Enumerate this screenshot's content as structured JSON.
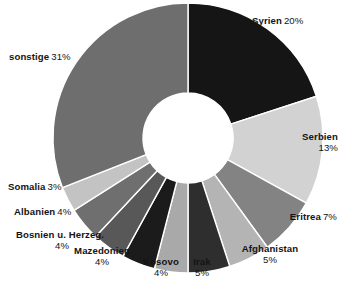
{
  "chart_data": {
    "type": "pie",
    "variant": "donut",
    "title": "",
    "subtitle": "",
    "xlabel": "",
    "ylabel": "",
    "unit": "%",
    "legend": "none",
    "grid": false,
    "start_angle_deg": 0,
    "direction": "clockwise",
    "total": 100,
    "categories": [
      "Syrien",
      "Serbien",
      "Eritrea",
      "Afghanistan",
      "Irak",
      "Kosovo",
      "Mazedonien",
      "Bosnien u. Herzeg.",
      "Albanien",
      "Somalia",
      "sonstige"
    ],
    "values": [
      20,
      13,
      7,
      5,
      5,
      4,
      4,
      4,
      4,
      3,
      31
    ],
    "colors": [
      "#151515",
      "#d2d2d2",
      "#838383",
      "#b4b4b4",
      "#2e2e2e",
      "#a9a9a9",
      "#1b1b1b",
      "#585858",
      "#6f6f6f",
      "#c3c3c3",
      "#6e6e6e"
    ],
    "slices": [
      {
        "name": "Syrien",
        "value": 20,
        "percent_label": "20%",
        "color": "#151515",
        "label_text": "Syrien 20%"
      },
      {
        "name": "Serbien",
        "value": 13,
        "percent_label": "13%",
        "color": "#d2d2d2",
        "label_text": "Serbien 13%"
      },
      {
        "name": "Eritrea",
        "value": 7,
        "percent_label": "7%",
        "color": "#838383",
        "label_text": "Eritrea 7%"
      },
      {
        "name": "Afghanistan",
        "value": 5,
        "percent_label": "5%",
        "color": "#b4b4b4",
        "label_text": "Afghanistan 5%"
      },
      {
        "name": "Irak",
        "value": 5,
        "percent_label": "5%",
        "color": "#2e2e2e",
        "label_text": "Irak 5%"
      },
      {
        "name": "Kosovo",
        "value": 4,
        "percent_label": "4%",
        "color": "#a9a9a9",
        "label_text": "Kosovo 4%"
      },
      {
        "name": "Mazedonien",
        "value": 4,
        "percent_label": "4%",
        "color": "#1b1b1b",
        "label_text": "Mazedonien 4%"
      },
      {
        "name": "Bosnien u. Herzeg.",
        "value": 4,
        "percent_label": "4%",
        "color": "#585858",
        "label_text": "Bosnien u. Herzeg. 4%"
      },
      {
        "name": "Albanien",
        "value": 4,
        "percent_label": "4%",
        "color": "#6f6f6f",
        "label_text": "Albanien 4%"
      },
      {
        "name": "Somalia",
        "value": 3,
        "percent_label": "3%",
        "color": "#c3c3c3",
        "label_text": "Somalia 3%"
      },
      {
        "name": "sonstige",
        "value": 31,
        "percent_label": "31%",
        "color": "#6e6e6e",
        "label_text": "sonstige 31%"
      }
    ]
  },
  "labels": {
    "syrien": {
      "name": "Syrien",
      "percent": "20%"
    },
    "serbien": {
      "name": "Serbien",
      "percent": "13%"
    },
    "eritrea": {
      "name": "Eritrea",
      "percent": "7%"
    },
    "afghanistan": {
      "name": "Afghanistan",
      "percent": "5%"
    },
    "irak": {
      "name": "Irak",
      "percent": "5%"
    },
    "kosovo": {
      "name": "Kosovo",
      "percent": "4%"
    },
    "mazedonien": {
      "name": "Mazedonien",
      "percent": "4%"
    },
    "bosnien": {
      "name": "Bosnien u. Herzeg.",
      "percent": "4%"
    },
    "albanien": {
      "name": "Albanien",
      "percent": "4%"
    },
    "somalia": {
      "name": "Somalia",
      "percent": "3%"
    },
    "sonstige": {
      "name": "sonstige",
      "percent": "31%"
    }
  }
}
